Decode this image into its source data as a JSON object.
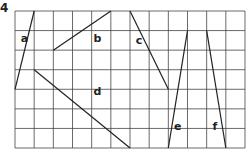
{
  "question_number": "4",
  "grid": {
    "columns": 12,
    "rows": 7
  },
  "segments": [
    {
      "label": "a",
      "from": [
        1,
        0
      ],
      "to": [
        0,
        4
      ],
      "label_at": [
        0.3,
        1.6
      ]
    },
    {
      "label": "b",
      "from": [
        2,
        2
      ],
      "to": [
        5,
        0
      ],
      "label_at": [
        4.1,
        1.6
      ]
    },
    {
      "label": "c",
      "from": [
        6,
        0
      ],
      "to": [
        8,
        4
      ],
      "label_at": [
        6.3,
        1.7
      ]
    },
    {
      "label": "d",
      "from": [
        1,
        3
      ],
      "to": [
        6,
        7
      ],
      "label_at": [
        4.1,
        4.3
      ]
    },
    {
      "label": "e",
      "from": [
        8,
        7
      ],
      "to": [
        9,
        1
      ],
      "label_at": [
        8.3,
        6.1
      ]
    },
    {
      "label": "f",
      "from": [
        10,
        1
      ],
      "to": [
        11,
        7
      ],
      "label_at": [
        10.3,
        6.1
      ]
    }
  ],
  "colors": {
    "grid": "#444444",
    "line": "#222222",
    "label": "#222222"
  }
}
